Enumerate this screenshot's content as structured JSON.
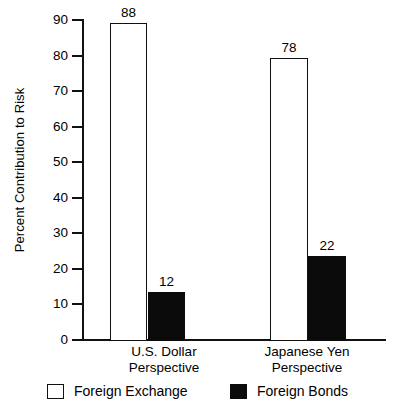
{
  "chart_data": {
    "type": "bar",
    "title": "",
    "subtitle": "",
    "xlabel": "",
    "ylabel": "Percent Contribution to Risk",
    "ylim": [
      0,
      90
    ],
    "yticks": [
      0,
      10,
      20,
      30,
      40,
      50,
      60,
      70,
      80,
      90
    ],
    "ytick_labels": [
      "0",
      "10",
      "20",
      "30",
      "40",
      "50",
      "60",
      "70",
      "80",
      "90"
    ],
    "grid": false,
    "legend_position": "bottom",
    "categories": [
      "U.S. Dollar Perspective",
      "Japanese Yen Perspective"
    ],
    "category_lines": [
      [
        "U.S. Dollar",
        "Perspective"
      ],
      [
        "Japanese Yen",
        "Perspective"
      ]
    ],
    "series": [
      {
        "name": "Foreign Exchange",
        "values": [
          88,
          78
        ],
        "value_labels": [
          "88",
          "78"
        ],
        "fill": "#ffffff",
        "edge": "#111111"
      },
      {
        "name": "Foreign Bonds",
        "values": [
          12,
          22
        ],
        "value_labels": [
          "12",
          "22"
        ],
        "fill": "#0b0b0b",
        "edge": "#0b0b0b"
      }
    ]
  },
  "legend": {
    "items": [
      {
        "label": "Foreign Exchange",
        "style": "open"
      },
      {
        "label": "Foreign Bonds",
        "style": "filled"
      }
    ]
  },
  "colors": {
    "axis": "#111111",
    "text": "#000000",
    "bar_open": "#ffffff",
    "bar_filled": "#0b0b0b",
    "background": "#ffffff"
  }
}
